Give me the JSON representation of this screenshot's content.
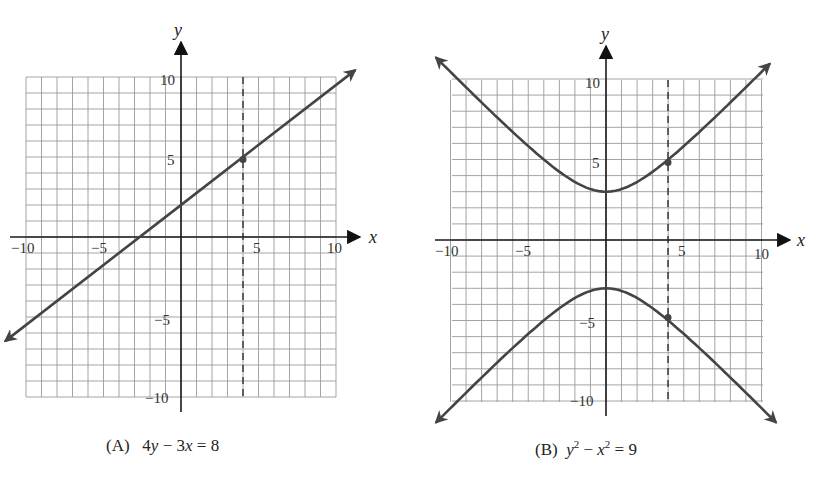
{
  "chart_data": [
    {
      "type": "line",
      "panel": "A",
      "title": "(A) 4y − 3x = 8",
      "caption_label": "(A)",
      "equation": "4y − 3x = 8",
      "xlabel": "x",
      "ylabel": "y",
      "xlim": [
        -10,
        10
      ],
      "ylim": [
        -10,
        10
      ],
      "xticks": [
        -10,
        -5,
        5,
        10
      ],
      "yticks": [
        10,
        5,
        -5,
        -10
      ],
      "grid": true,
      "grid_step": 1,
      "series": [
        {
          "name": "4y - 3x = 8",
          "x": [
            -11,
            -10,
            -5,
            0,
            4,
            5,
            10,
            11
          ],
          "y": [
            -6.25,
            -5.5,
            -1.75,
            2,
            5,
            5.75,
            9.5,
            10.25
          ]
        }
      ],
      "annotations": [
        {
          "type": "vertical-dashed-line",
          "x": 4
        },
        {
          "type": "point",
          "x": 4,
          "y": 5
        }
      ]
    },
    {
      "type": "line",
      "panel": "B",
      "title": "(B) y² − x² = 9",
      "caption_label": "(B)",
      "equation": "y² − x² = 9",
      "xlabel": "x",
      "ylabel": "y",
      "xlim": [
        -10,
        10
      ],
      "ylim": [
        -10,
        10
      ],
      "xticks": [
        -10,
        -5,
        5,
        10
      ],
      "yticks": [
        10,
        5,
        -5,
        -10
      ],
      "grid": true,
      "grid_step": 1,
      "series": [
        {
          "name": "upper branch y = sqrt(x^2+9)",
          "x": [
            -11,
            -10,
            -5,
            -4,
            0,
            4,
            5,
            10,
            11
          ],
          "y": [
            11.4,
            10.44,
            5.83,
            5,
            3,
            5,
            5.83,
            10.44,
            11.4
          ]
        },
        {
          "name": "lower branch y = -sqrt(x^2+9)",
          "x": [
            -11,
            -10,
            -5,
            -4,
            0,
            4,
            5,
            10,
            11
          ],
          "y": [
            -11.4,
            -10.44,
            -5.83,
            -5,
            -3,
            -5,
            -5.83,
            -10.44,
            -11.4
          ]
        }
      ],
      "annotations": [
        {
          "type": "vertical-dashed-line",
          "x": 4
        },
        {
          "type": "point",
          "x": 4,
          "y": 5
        },
        {
          "type": "point",
          "x": 4,
          "y": -5
        }
      ]
    }
  ],
  "panels": {
    "A": {
      "caption_label": "(A)",
      "caption_eq_parts": [
        "4",
        "y",
        " − 3",
        "x",
        " = 8"
      ],
      "x_axis_label": "x",
      "y_axis_label": "y",
      "tick_labels": {
        "x_neg10": "−10",
        "x_neg5": "−5",
        "x_5": "5",
        "x_10": "10",
        "y_10": "10",
        "y_5": "5",
        "y_neg5": "−5",
        "y_neg10": "−10"
      }
    },
    "B": {
      "caption_label": "(B)",
      "caption_eq_parts": [
        "y",
        "2",
        " − ",
        "x",
        "2",
        " = 9"
      ],
      "x_axis_label": "x",
      "y_axis_label": "y",
      "tick_labels": {
        "x_neg10": "−10",
        "x_neg5": "−5",
        "x_5": "5",
        "x_10": "10",
        "y_10": "10",
        "y_5": "5",
        "y_neg5": "−5",
        "y_neg10": "−10"
      }
    }
  },
  "colors": {
    "curve": "#444444",
    "axis": "#1a1a1a",
    "grid": "#9a9a9a",
    "background": "#ffffff"
  }
}
